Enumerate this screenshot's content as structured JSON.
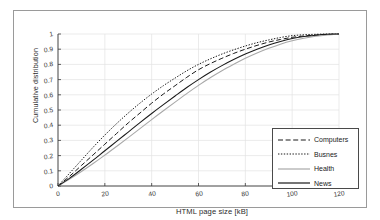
{
  "chart_data": {
    "type": "line",
    "title": "",
    "xlabel": "HTML page size [kB]",
    "ylabel": "Cumulative distribution",
    "xlim": [
      0,
      120
    ],
    "ylim": [
      0,
      1
    ],
    "grid": true,
    "legend_position": "lower right",
    "xticks": [
      "0",
      "20",
      "40",
      "60",
      "80",
      "100",
      "120"
    ],
    "xtick_values": [
      0,
      20,
      40,
      60,
      80,
      100,
      120
    ],
    "yticks": [
      "0",
      "0.1",
      "0.2",
      "0.3",
      "0.4",
      "0.5",
      "0.6",
      "0.7",
      "0.8",
      "0.9",
      "1"
    ],
    "ytick_values": [
      0,
      0.1,
      0.2,
      0.3,
      0.4,
      0.5,
      0.6,
      0.7,
      0.8,
      0.9,
      1
    ],
    "x": [
      0,
      5,
      10,
      15,
      20,
      25,
      30,
      35,
      40,
      45,
      50,
      55,
      60,
      65,
      70,
      75,
      80,
      85,
      90,
      95,
      100,
      105,
      110,
      115,
      120
    ],
    "series": [
      {
        "name": "Computers",
        "style": "dashed",
        "color": "#1a1a1a",
        "values": [
          0,
          0.065,
          0.135,
          0.205,
          0.275,
          0.345,
          0.415,
          0.48,
          0.545,
          0.605,
          0.66,
          0.715,
          0.765,
          0.805,
          0.84,
          0.872,
          0.9,
          0.925,
          0.947,
          0.964,
          0.978,
          0.987,
          0.993,
          0.997,
          1.0
        ]
      },
      {
        "name": "Busnes",
        "style": "dotted",
        "color": "#1a1a1a",
        "values": [
          0,
          0.085,
          0.17,
          0.255,
          0.335,
          0.41,
          0.48,
          0.545,
          0.605,
          0.66,
          0.71,
          0.758,
          0.8,
          0.836,
          0.868,
          0.896,
          0.921,
          0.943,
          0.961,
          0.977,
          0.989,
          0.995,
          0.998,
          1.0,
          1.0
        ]
      },
      {
        "name": "Health",
        "style": "solid",
        "color": "#a8a8a8",
        "values": [
          0,
          0.045,
          0.095,
          0.148,
          0.203,
          0.26,
          0.318,
          0.377,
          0.437,
          0.495,
          0.552,
          0.608,
          0.662,
          0.712,
          0.758,
          0.8,
          0.84,
          0.875,
          0.906,
          0.933,
          0.955,
          0.972,
          0.985,
          0.994,
          1.0
        ]
      },
      {
        "name": "News",
        "style": "solid",
        "color": "#1a1a1a",
        "values": [
          0,
          0.052,
          0.11,
          0.17,
          0.232,
          0.293,
          0.355,
          0.417,
          0.477,
          0.535,
          0.592,
          0.648,
          0.7,
          0.748,
          0.792,
          0.832,
          0.868,
          0.9,
          0.928,
          0.951,
          0.97,
          0.983,
          0.992,
          0.998,
          1.0
        ]
      }
    ]
  },
  "legend": {
    "entries": [
      {
        "label": "Computers"
      },
      {
        "label": "Busnes"
      },
      {
        "label": "Health"
      },
      {
        "label": "News"
      }
    ]
  },
  "colors": {
    "axis": "#3a3a3a",
    "grid": "#e2e2e2",
    "frame": "#9a9a9a",
    "background": "#ffffff"
  }
}
